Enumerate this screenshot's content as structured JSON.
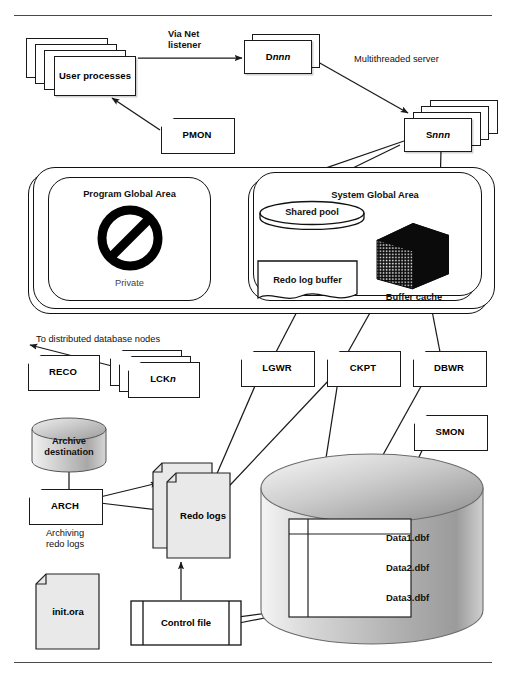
{
  "diagram": {
    "type": "architecture-diagram"
  },
  "nodes": {
    "user_processes": {
      "label": "User\nprocesses",
      "stack": 4
    },
    "dispatcher": {
      "label_prefix": "D",
      "label_italic": "nnn",
      "stack": 2
    },
    "server": {
      "label_prefix": "S",
      "label_italic": "nnn",
      "stack": 4
    },
    "pmon": {
      "label": "PMON"
    },
    "lckn": {
      "label_prefix": "LCK",
      "label_italic": "n",
      "stack": 3
    },
    "reco": {
      "label": "RECO"
    },
    "lgwr": {
      "label": "LGWR"
    },
    "ckpt": {
      "label": "CKPT"
    },
    "dbwr": {
      "label": "DBWR"
    },
    "smon": {
      "label": "SMON"
    },
    "arch": {
      "label": "ARCH"
    },
    "pga": {
      "label": "Program Global Area",
      "sublabel": "Private"
    },
    "sga": {
      "label": "System Global Area"
    },
    "shared_pool": {
      "label": "Shared pool"
    },
    "redo_log_buffer": {
      "label": "Redo log buffer"
    },
    "buffer_cache": {
      "label": "Buffer cache"
    },
    "archive_dest": {
      "label": "Archive\ndestination"
    },
    "redo_logs": {
      "label": "Redo\nlogs",
      "stack": 2
    },
    "init_ora": {
      "label": "init.ora"
    },
    "control_file": {
      "label": "Control file"
    },
    "database": {
      "datafiles": [
        "Data1.dbf",
        "Data2.dbf",
        "Data3.dbf"
      ]
    }
  },
  "annotations": {
    "via_net_listener": "Via Net\nlistener",
    "multithreaded_server": "Multithreaded server",
    "to_distributed_nodes": "To distributed database nodes",
    "archiving_redo_logs": "Archiving\nredo logs"
  },
  "colors": {
    "line": "#1a1a1a",
    "rule": "#4a4a4a",
    "file_fill": "#e9e9e9",
    "cylinder_fill": "#b9b9b9",
    "page_background": "#ffffff"
  }
}
